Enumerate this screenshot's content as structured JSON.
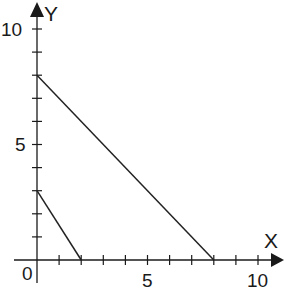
{
  "chart_data": {
    "type": "line",
    "title": "",
    "xlabel": "X",
    "ylabel": "Y",
    "xlim": [
      0,
      11
    ],
    "ylim": [
      0,
      10.7
    ],
    "x_ticks": [
      0,
      1,
      2,
      3,
      4,
      5,
      6,
      7,
      8,
      9,
      10
    ],
    "y_ticks": [
      1,
      2,
      3,
      4,
      5,
      6,
      7,
      8,
      9,
      10
    ],
    "x_tick_labels": [
      "0",
      "5",
      "10"
    ],
    "y_tick_labels": [
      "5",
      "10"
    ],
    "grid": false,
    "legend": null,
    "series": [
      {
        "name": "line-1",
        "x": [
          0,
          8
        ],
        "y": [
          8,
          0
        ]
      },
      {
        "name": "line-2",
        "x": [
          0,
          2
        ],
        "y": [
          3,
          0
        ]
      }
    ]
  },
  "labels": {
    "x_axis": "X",
    "y_axis": "Y",
    "origin": "0",
    "x5": "5",
    "x10": "10",
    "y5": "5",
    "y10": "10"
  },
  "colors": {
    "axis": "#1a1a1a",
    "line": "#222222"
  }
}
